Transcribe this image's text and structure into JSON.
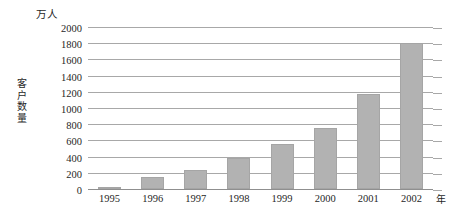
{
  "chart_data": {
    "type": "bar",
    "title": "",
    "subtitle": "",
    "unit_label": "万人",
    "ylabel": "客户数量",
    "xlabel": "年",
    "categories": [
      "1995",
      "1996",
      "1997",
      "1998",
      "1999",
      "2000",
      "2001",
      "2002"
    ],
    "values": [
      20,
      150,
      230,
      380,
      550,
      750,
      1170,
      1800
    ],
    "series": [
      {
        "name": "客户数量",
        "values": [
          20,
          150,
          230,
          380,
          550,
          750,
          1170,
          1800
        ]
      }
    ],
    "ylim": [
      0,
      2000
    ],
    "ytick_labels": [
      "0",
      "200",
      "400",
      "600",
      "800",
      "1000",
      "1200",
      "1400",
      "1600",
      "1800",
      "2000"
    ],
    "ytick_values": [
      0,
      200,
      400,
      600,
      800,
      1000,
      1200,
      1400,
      1600,
      1800,
      2000
    ],
    "ytick_interval": 200,
    "grid": true,
    "grid_axis": "y",
    "legend": false,
    "legend_position": "none",
    "bar_color": "#b2b2b2",
    "grid_color": "#a8a8a8",
    "axis_color": "#8f8f8f",
    "text_color": "#1f1f1f",
    "background": "#ffffff"
  }
}
